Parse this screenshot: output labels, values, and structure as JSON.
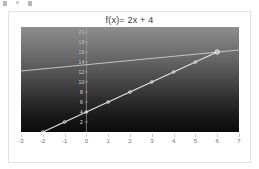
{
  "figure": {
    "title": "f(x)= 2x + 4"
  },
  "axes": {
    "x_ticks": [
      "-3",
      "-2",
      "-1",
      "0",
      "1",
      "2",
      "3",
      "4",
      "5",
      "6",
      "7"
    ],
    "y_ticks": [
      "2",
      "4",
      "6",
      "8",
      "10",
      "12",
      "14",
      "16",
      "18",
      "20"
    ]
  },
  "colors": {
    "plot_top": "#8e8e8e",
    "plot_bottom": "#0b0b0b",
    "line_primary": "#e6e6e6",
    "line_secondary": "#cfcfcf",
    "marker": "#f2f2f2",
    "frame": "#e2e2e2",
    "title_text": "#3a3a3a",
    "xlabel_text": "#6f6f6f",
    "ylabel_text": "#e8e8e8"
  },
  "chart_data": {
    "type": "line",
    "title": "f(x)= 2x + 4",
    "xlabel": "",
    "ylabel": "",
    "xlim": [
      -3,
      7
    ],
    "ylim": [
      0,
      21
    ],
    "grid": false,
    "legend": "none",
    "series": [
      {
        "name": "f(x)= 2x + 4",
        "x": [
          -2,
          -1,
          0,
          1,
          2,
          3,
          4,
          5,
          6
        ],
        "values": [
          0,
          2,
          4,
          6,
          8,
          10,
          12,
          14,
          16
        ],
        "markers": true,
        "color": "#e6e6e6"
      },
      {
        "name": "secondary line",
        "x": [
          -3,
          7
        ],
        "values": [
          12.2,
          16.4
        ],
        "markers": false,
        "color": "#cfcfcf"
      }
    ],
    "annotations": [
      {
        "text": "intersection",
        "x": 6,
        "y": 16
      }
    ]
  }
}
